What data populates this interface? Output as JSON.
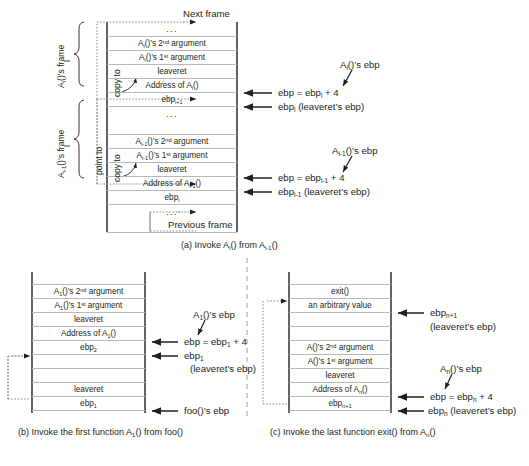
{
  "figure": {
    "panel_a": {
      "caption": "(a) Invoke A_i() from A_{i-1}()",
      "top_label": "Next frame",
      "bottom_label": "Previous frame",
      "frame_labels": [
        "A_i()'s frame",
        "A_{i-1}()'s frame"
      ],
      "annotations": [
        "copy to",
        "point to",
        "copy to"
      ],
      "upper_rows": [
        "...",
        "A_i()'s 2nd argument",
        "A_i()'s 1st argument",
        "leaveret",
        "Address of A_i()",
        "ebp_{i+1}"
      ],
      "lower_rows": [
        "...",
        "A_{i-1}()'s 2nd argument",
        "A_{i-1}()'s 1st argument",
        "leaveret",
        "Address of A_{i-1}()",
        "ebp_i"
      ],
      "middle_dots": "...",
      "right_labels_upper": {
        "callout": "A_i()'s ebp",
        "arrow1": "ebp = ebp_i + 4",
        "arrow2": "ebp_i (leaveret's ebp)"
      },
      "right_labels_lower": {
        "callout": "A_{i-1}()'s ebp",
        "arrow1": "ebp = ebp_{i-1} + 4",
        "arrow2": "ebp_{i-1} (leaveret's ebp)"
      }
    },
    "panel_b": {
      "caption": "(b) Invoke the first function A_1() from foo()",
      "rows": [
        "A_1()'s 2nd argument",
        "A_1()'s 1st argument",
        "leaveret",
        "Address of A_1()",
        "ebp_2",
        "",
        "",
        "leaveret",
        "ebp_1"
      ],
      "right_labels": {
        "callout": "A_1()'s ebp",
        "arrow1": "ebp = ebp_1 + 4",
        "arrow2": "ebp_1",
        "arrow2_sub": "(leaveret's ebp)",
        "arrow3": "foo()'s ebp"
      }
    },
    "panel_c": {
      "caption": "(c) Invoke the last function exit() from A_n()",
      "rows": [
        "exit()",
        "an arbitrary value",
        "",
        "",
        "A()'s 2nd argument",
        "A()'s 1st argument",
        "leaveret",
        "Address of A_n()",
        "ebp_{n+1}"
      ],
      "right_labels": {
        "arrow_top": "ebp_{n+1}",
        "arrow_top_sub": "(leaveret's ebp)",
        "callout": "A_n()'s ebp",
        "arrow1": "ebp = ebp_n + 4",
        "arrow2": "ebp_n (leaveret's ebp)"
      }
    }
  },
  "colors": {
    "ink": "#231f20",
    "rule": "#b9b9b9",
    "rail": "#3b3b3b",
    "dotted": "#8c8c8c",
    "divider": "#9a9a9a"
  }
}
